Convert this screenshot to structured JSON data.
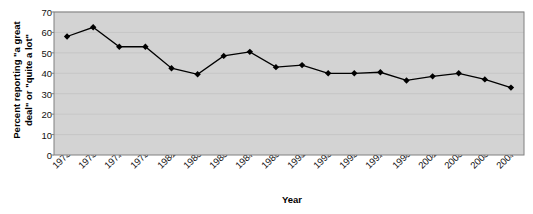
{
  "chart_data": {
    "type": "line",
    "title": "",
    "xlabel": "Year",
    "ylabel": "Percent reporting \"a great deal\" or \"quite a lot\"",
    "ylabel_line1": "Percent reporting \"a great",
    "ylabel_line2": "deal\" or \"quite a lot\"",
    "x": [
      1973,
      1975,
      1977,
      1979,
      1981,
      1983,
      1985,
      1987,
      1989,
      1991,
      1993,
      1995,
      1997,
      1999,
      2001,
      2003,
      2005,
      2007
    ],
    "values": [
      58,
      62.5,
      53,
      53,
      42.5,
      39.5,
      48.5,
      50.5,
      43,
      44,
      40,
      40,
      40.5,
      36.5,
      38.5,
      40,
      37,
      33
    ],
    "xticklabels": [
      "1973",
      "1975",
      "1977",
      "1979",
      "1981",
      "1983",
      "1985",
      "1987",
      "1989",
      "1991",
      "1993",
      "1995",
      "1997",
      "1999",
      "2001",
      "2003",
      "2005",
      "2007"
    ],
    "yticklabels": [
      "0",
      "10",
      "20",
      "30",
      "40",
      "50",
      "60",
      "70"
    ],
    "ytickvalues": [
      0,
      10,
      20,
      30,
      40,
      50,
      60,
      70
    ],
    "ylim": [
      0,
      70
    ],
    "xlim": [
      1972,
      2008
    ],
    "grid": "horizontal",
    "legend": "none",
    "marker": "diamond",
    "series_color": "#000000",
    "plot_background": "#d3d3d3",
    "gridline_color": "#c0c0c0",
    "border_color": "#808080"
  }
}
